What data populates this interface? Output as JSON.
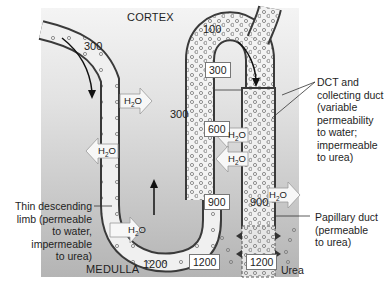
{
  "zones": {
    "top": "CORTEX",
    "bottom": "MEDULLA"
  },
  "osmolarity_boxes": [
    "300",
    "600",
    "900",
    "1200",
    "1200"
  ],
  "tubule_values": {
    "descending_start": "300",
    "loop_top": "100",
    "ascending_mid": "300",
    "loop_bottom": "1200",
    "collecting_900": "900"
  },
  "water_label": "H2O",
  "urea_label": "Urea",
  "labels": {
    "dct": [
      "DCT and",
      "collecting duct",
      "(variable",
      "permeability",
      "to water;",
      "impermeable",
      "to urea)"
    ],
    "thin_descending": [
      "Thin descending",
      "limb (permeable",
      "to water,",
      "impermeable",
      "to urea)"
    ],
    "papillary": [
      "Papillary duct",
      "(permeable",
      "to urea)"
    ]
  },
  "colors": {
    "cortex_bg": "#ececec",
    "medulla_bg": "#b9b9b9",
    "tubule_fill": "#f2f2f2",
    "wall": "#3a3a3a"
  }
}
